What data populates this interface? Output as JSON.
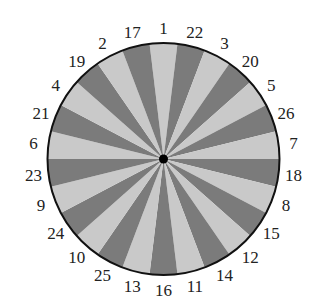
{
  "wheel": {
    "center": [
      163.5,
      159
    ],
    "radius": 116,
    "label_radius": 131,
    "sector_count": 26,
    "colors": {
      "light": "#c9c9c9",
      "dark": "#7b7b7b",
      "rim": "#111111",
      "hub": "#000000"
    },
    "labels_clockwise_from_top": [
      "1",
      "22",
      "3",
      "20",
      "5",
      "26",
      "7",
      "18",
      "8",
      "15",
      "12",
      "14",
      "11",
      "16",
      "13",
      "25",
      "10",
      "24",
      "9",
      "23",
      "6",
      "21",
      "4",
      "19",
      "2",
      "17"
    ],
    "first_sector_shade": "light"
  }
}
